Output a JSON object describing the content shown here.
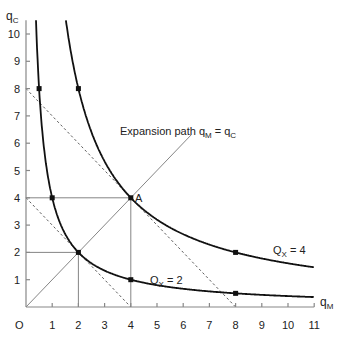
{
  "chart_data": {
    "type": "line",
    "title": "",
    "xlabel": "qM",
    "ylabel": "qC",
    "origin_label": "O",
    "xlim": [
      0,
      11
    ],
    "ylim": [
      0,
      10.5
    ],
    "x_ticks": [
      1,
      2,
      3,
      4,
      5,
      6,
      7,
      8,
      9,
      10,
      11
    ],
    "y_ticks": [
      1,
      2,
      3,
      4,
      5,
      6,
      7,
      8,
      9,
      10
    ],
    "grid": false,
    "series": [
      {
        "name": "Qx = 2",
        "function": "qC = 4 / qM",
        "marked_points": [
          [
            0.5,
            8
          ],
          [
            1,
            4
          ],
          [
            2,
            2
          ],
          [
            4,
            1
          ],
          [
            8,
            0.5
          ]
        ]
      },
      {
        "name": "Qx = 4",
        "function": "qC = 16 / qM",
        "marked_points": [
          [
            2,
            8
          ],
          [
            4,
            4
          ],
          [
            8,
            2
          ]
        ]
      },
      {
        "name": "Expansion path qM = qC",
        "function": "qC = qM",
        "range": [
          0,
          6.3
        ]
      },
      {
        "name": "Isocost 1 (dashed)",
        "points": [
          [
            0,
            4
          ],
          [
            4,
            0
          ]
        ]
      },
      {
        "name": "Isocost 2 (dashed)",
        "points": [
          [
            0,
            8
          ],
          [
            8,
            0
          ]
        ]
      }
    ],
    "annotations": [
      {
        "text": "Expansion path qM = qC",
        "at": [
          4.5,
          6.4
        ]
      },
      {
        "text": "A",
        "at": [
          4,
          4
        ]
      },
      {
        "text": "Qx = 2",
        "at": [
          5.3,
          1.1
        ]
      },
      {
        "text": "Qx = 4",
        "at": [
          9.4,
          2.2
        ]
      }
    ],
    "guide_lines": [
      {
        "from": [
          0,
          4
        ],
        "to": [
          4,
          4
        ]
      },
      {
        "from": [
          4,
          0
        ],
        "to": [
          4,
          4
        ]
      },
      {
        "from": [
          0,
          2
        ],
        "to": [
          2,
          2
        ]
      },
      {
        "from": [
          2,
          0
        ],
        "to": [
          2,
          2
        ]
      }
    ]
  },
  "labels": {
    "y_axis": "q",
    "y_axis_sub": "C",
    "x_axis": "q",
    "x_axis_sub": "M",
    "origin": "O",
    "expansion": "Expansion path q",
    "expansion_sub1": "M",
    "expansion_mid": " = q",
    "expansion_sub2": "C",
    "point_a": "A",
    "qx2": "Q",
    "qx2_sub": "X",
    "qx2_val": " = 2",
    "qx4": "Q",
    "qx4_sub": "X",
    "qx4_val": " = 4"
  }
}
